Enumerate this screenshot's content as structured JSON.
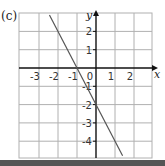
{
  "panel_label": "(c)",
  "chart_data": {
    "type": "line",
    "title": "",
    "xlabel": "x",
    "ylabel": "y",
    "xlim": [
      -3.5,
      2.5
    ],
    "ylim": [
      -4.8,
      2.9
    ],
    "xticks": [
      -3,
      -2,
      -1,
      0,
      1,
      2
    ],
    "yticks": [
      -4,
      -3,
      -2,
      -1,
      1,
      2
    ],
    "grid": true,
    "series": [
      {
        "name": "y = -2x - 2",
        "x": [
          -2.45,
          1.4
        ],
        "y": [
          2.9,
          -4.8
        ]
      }
    ],
    "colors": {
      "grid": "#b0b0b0",
      "axis": "#111111",
      "line": "#555555",
      "bar": "#555555"
    }
  }
}
